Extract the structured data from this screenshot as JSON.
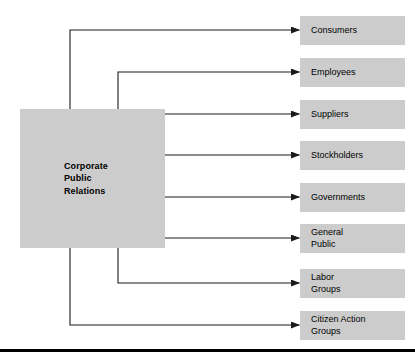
{
  "figure": {
    "hub": {
      "label": "Corporate\nPublic\nRelations",
      "x": 20,
      "y": 109,
      "width": 145,
      "height": 139
    },
    "colors": {
      "box_fill": "#cccccc",
      "line": "#1a1a1a",
      "text": "#000000",
      "background": "#ffffff",
      "rule": "#000000"
    },
    "nodes": [
      {
        "label": "Consumers",
        "y": 16,
        "arrow_y": 30,
        "route": "top",
        "trunk_x": 70
      },
      {
        "label": "Employees",
        "y": 58,
        "arrow_y": 72,
        "route": "top",
        "trunk_x": 118
      },
      {
        "label": "Suppliers",
        "y": 100,
        "arrow_y": 114,
        "route": "right",
        "trunk_x": 165
      },
      {
        "label": "Stockholders",
        "y": 141,
        "arrow_y": 155,
        "route": "right",
        "trunk_x": 165
      },
      {
        "label": "Governments",
        "y": 183,
        "arrow_y": 197,
        "route": "right",
        "trunk_x": 165
      },
      {
        "label": "General\nPublic",
        "y": 224,
        "arrow_y": 238,
        "route": "right",
        "trunk_x": 165
      },
      {
        "label": "Labor\nGroups",
        "y": 269,
        "arrow_y": 283,
        "route": "bottom",
        "trunk_x": 118
      },
      {
        "label": "Citizen Action\nGroups",
        "y": 311,
        "arrow_y": 325,
        "route": "bottom",
        "trunk_x": 70
      }
    ],
    "bottom_rule": {
      "y": 349,
      "height": 3
    }
  }
}
